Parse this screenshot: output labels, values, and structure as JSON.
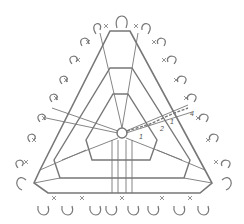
{
  "diagram": {
    "type": "crochet-chart",
    "shape": "triangle",
    "stroke_color": "#777777",
    "background": "#ffffff",
    "row_labels": [
      {
        "text": "1",
        "x": 139,
        "y": 133
      },
      {
        "text": "2",
        "x": 160,
        "y": 125
      },
      {
        "text": "1",
        "x": 170,
        "y": 118
      },
      {
        "text": "4",
        "x": 190,
        "y": 110
      }
    ],
    "center_ring": {
      "x": 122,
      "y": 133,
      "r": 5
    }
  }
}
